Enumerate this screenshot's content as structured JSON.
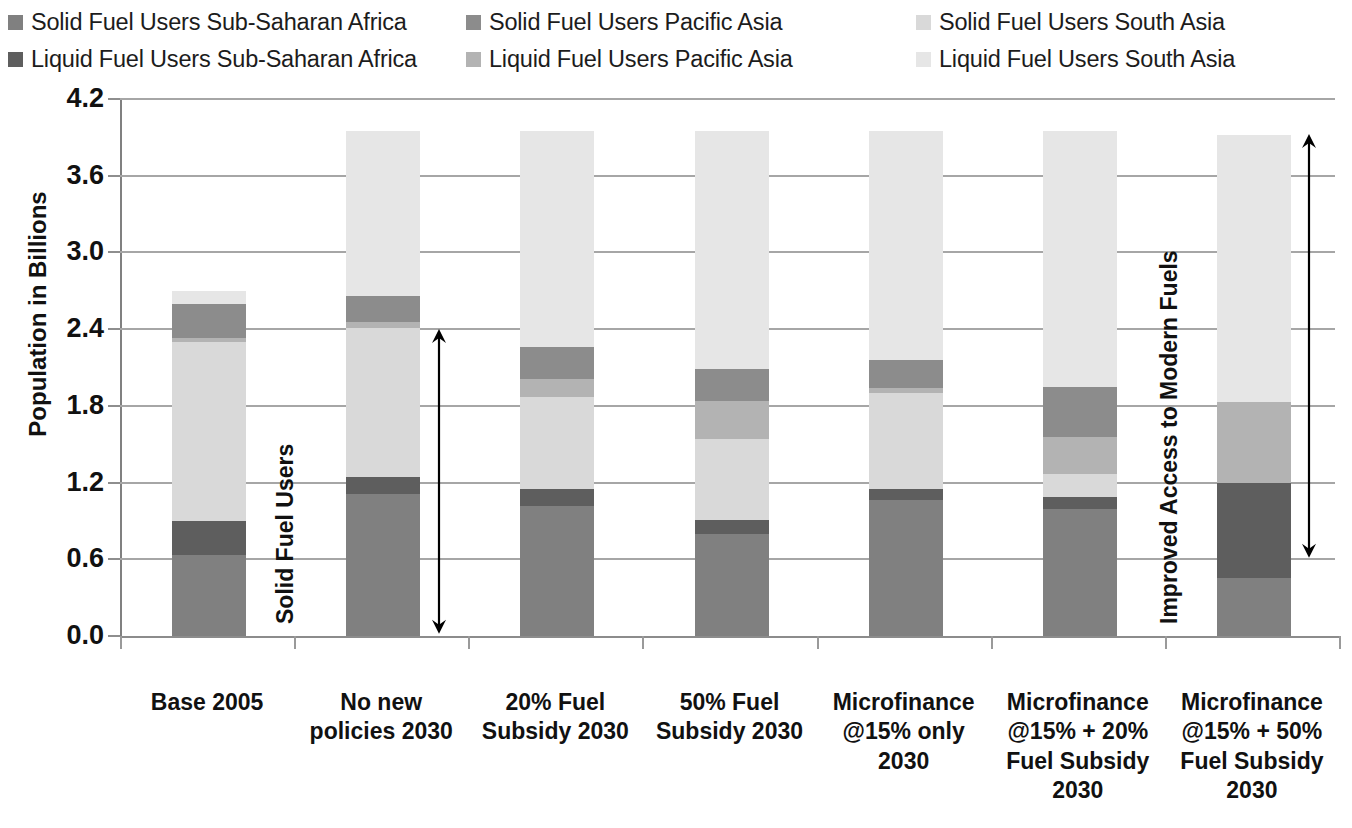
{
  "legend": {
    "items": [
      {
        "label": "Solid Fuel Users Sub-Saharan Africa",
        "color": "#808080",
        "key": "solid_ssa"
      },
      {
        "label": "Liquid Fuel Users Sub-Saharan Africa",
        "color": "#5e5e5e",
        "key": "liquid_ssa"
      },
      {
        "label": "Solid Fuel Users Pacific Asia",
        "color": "#8c8c8c",
        "key": "solid_pac"
      },
      {
        "label": "Liquid Fuel Users Pacific Asia",
        "color": "#b3b3b3",
        "key": "liquid_pac"
      },
      {
        "label": "Solid Fuel Users South Asia",
        "color": "#d9d9d9",
        "key": "solid_sa"
      },
      {
        "label": "Liquid Fuel Users South Asia",
        "color": "#e6e6e6",
        "key": "liquid_sa"
      }
    ]
  },
  "annotations": [
    {
      "name": "solid-fuel-users-annotation",
      "text": "Solid Fuel Users"
    },
    {
      "name": "improved-access-annotation",
      "text": "Improved Access  to Modern Fuels"
    }
  ],
  "chart_data": {
    "type": "bar",
    "stacked": true,
    "title": "",
    "xlabel": "",
    "ylabel": "Population in Billions",
    "ylim": [
      0.0,
      4.2
    ],
    "ytick_labels": [
      "0.0",
      "0.6",
      "1.2",
      "1.8",
      "2.4",
      "3.0",
      "3.6",
      "4.2"
    ],
    "ytick_values": [
      0.0,
      0.6,
      1.2,
      1.8,
      2.4,
      3.0,
      3.6,
      4.2
    ],
    "grid": true,
    "legend_position": "top",
    "categories": [
      "Base 2005",
      "No new policies 2030",
      "20% Fuel Subsidy 2030",
      "50% Fuel Subsidy 2030",
      "Microfinance @15% only 2030",
      "Microfinance @15% + 20% Fuel Subsidy 2030",
      "Microfinance @15% + 50% Fuel Subsidy 2030"
    ],
    "category_lines": [
      [
        "Base 2005"
      ],
      [
        "No new",
        "policies 2030"
      ],
      [
        "20% Fuel",
        "Subsidy 2030"
      ],
      [
        "50% Fuel",
        "Subsidy 2030"
      ],
      [
        "Microfinance",
        "@15% only",
        "2030"
      ],
      [
        "Microfinance",
        "@15% + 20%",
        "Fuel Subsidy",
        "2030"
      ],
      [
        "Microfinance",
        "@15% + 50%",
        "Fuel Subsidy",
        "2030"
      ]
    ],
    "series": [
      {
        "name": "Solid Fuel Users Sub-Saharan Africa",
        "color": "#808080",
        "values": [
          0.63,
          1.11,
          1.02,
          0.8,
          1.06,
          0.99,
          0.45
        ]
      },
      {
        "name": "Liquid Fuel Users Sub-Saharan Africa",
        "color": "#5e5e5e",
        "values": [
          0.27,
          0.13,
          0.13,
          0.11,
          0.09,
          0.1,
          0.75
        ]
      },
      {
        "name": "Solid Fuel Users South Asia",
        "color": "#d9d9d9",
        "values": [
          1.4,
          1.17,
          0.72,
          0.63,
          0.75,
          0.18,
          0.0
        ]
      },
      {
        "name": "Liquid Fuel Users Pacific Asia",
        "color": "#b3b3b3",
        "values": [
          0.03,
          0.05,
          0.14,
          0.3,
          0.04,
          0.29,
          0.63
        ]
      },
      {
        "name": "Solid Fuel Users Pacific Asia",
        "color": "#8c8c8c",
        "values": [
          0.27,
          0.2,
          0.25,
          0.25,
          0.22,
          0.39,
          0.0
        ]
      },
      {
        "name": "Liquid Fuel Users South Asia",
        "color": "#e6e6e6",
        "values": [
          0.1,
          1.29,
          1.69,
          1.86,
          1.79,
          2.0,
          2.09
        ]
      }
    ],
    "stack_order_bottom_to_top": [
      "Solid Fuel Users Sub-Saharan Africa",
      "Liquid Fuel Users Sub-Saharan Africa",
      "Solid Fuel Users South Asia",
      "Liquid Fuel Users Pacific Asia",
      "Solid Fuel Users Pacific Asia",
      "Liquid Fuel Users South Asia"
    ],
    "bar_totals": [
      2.7,
      3.95,
      3.95,
      3.95,
      3.95,
      3.95,
      3.92
    ]
  }
}
